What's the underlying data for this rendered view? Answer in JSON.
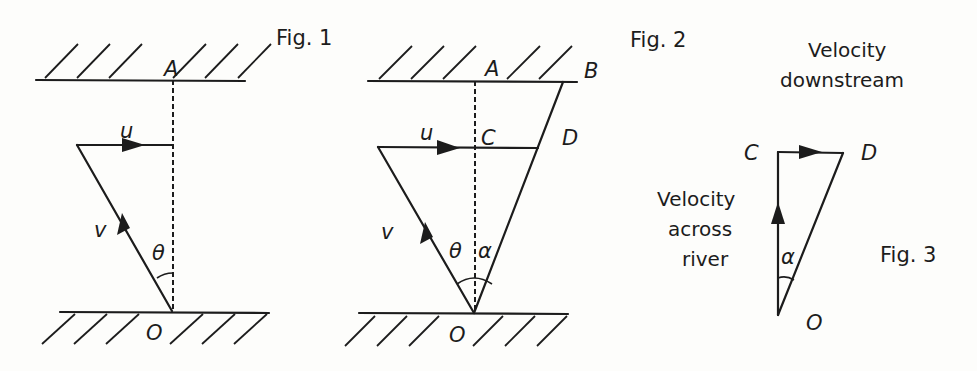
{
  "figures": [
    {
      "id": "fig1",
      "caption": "Fig. 1",
      "labels": {
        "A": "A",
        "O": "O",
        "u": "u",
        "v": "v",
        "theta": "θ"
      }
    },
    {
      "id": "fig2",
      "caption": "Fig. 2",
      "labels": {
        "A": "A",
        "B": "B",
        "C": "C",
        "D": "D",
        "O": "O",
        "u": "u",
        "v": "v",
        "theta": "θ",
        "alpha": "α"
      }
    },
    {
      "id": "fig3",
      "caption": "Fig. 3",
      "labels": {
        "C": "C",
        "D": "D",
        "O": "O",
        "alpha": "α"
      },
      "annotations": {
        "downstream_line1": "Velocity",
        "downstream_line2": "downstream",
        "across_line1": "Velocity",
        "across_line2": "across",
        "across_line3": "river"
      }
    }
  ],
  "colors": {
    "ink": "#1c1c1c",
    "paper": "#fdfdfb"
  }
}
